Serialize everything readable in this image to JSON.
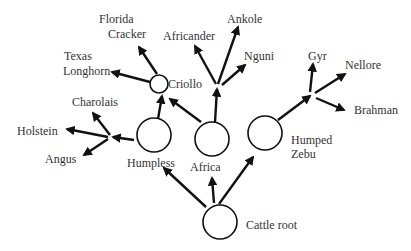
{
  "diagram": {
    "nodes": {
      "root": {
        "label": "Cattle root"
      },
      "humpless": {
        "label": "Humpless"
      },
      "africa": {
        "label": "Africa"
      },
      "zebu": {
        "label_line1": "Humped",
        "label_line2": "Zebu"
      },
      "criollo": {
        "label": "Criollo"
      }
    },
    "leaves": {
      "florida_cracker": {
        "line1": "Florida",
        "line2": "Cracker"
      },
      "texas_longhorn": {
        "line1": "Texas",
        "line2": "Longhorn"
      },
      "charolais": {
        "label": "Charolais"
      },
      "holstein": {
        "label": "Holstein"
      },
      "angus": {
        "label": "Angus"
      },
      "africander": {
        "label": "Africander"
      },
      "ankole": {
        "label": "Ankole"
      },
      "nguni": {
        "label": "Nguni"
      },
      "gyr": {
        "label": "Gyr"
      },
      "nellore": {
        "label": "Nellore"
      },
      "brahman": {
        "label": "Brahman"
      }
    },
    "edges": [
      {
        "from": "Cattle root",
        "to": "Humpless"
      },
      {
        "from": "Cattle root",
        "to": "Africa"
      },
      {
        "from": "Cattle root",
        "to": "Humped Zebu"
      },
      {
        "from": "Humpless",
        "to": "Criollo"
      },
      {
        "from": "Africa",
        "to": "Criollo"
      },
      {
        "from": "Humpless",
        "to": "Charolais"
      },
      {
        "from": "Humpless",
        "to": "Holstein"
      },
      {
        "from": "Humpless",
        "to": "Angus"
      },
      {
        "from": "Criollo",
        "to": "Florida Cracker"
      },
      {
        "from": "Criollo",
        "to": "Texas Longhorn"
      },
      {
        "from": "Africa",
        "to": "Africander"
      },
      {
        "from": "Africa",
        "to": "Ankole"
      },
      {
        "from": "Africa",
        "to": "Nguni"
      },
      {
        "from": "Humped Zebu",
        "to": "Gyr"
      },
      {
        "from": "Humped Zebu",
        "to": "Nellore"
      },
      {
        "from": "Humped Zebu",
        "to": "Brahman"
      }
    ]
  }
}
